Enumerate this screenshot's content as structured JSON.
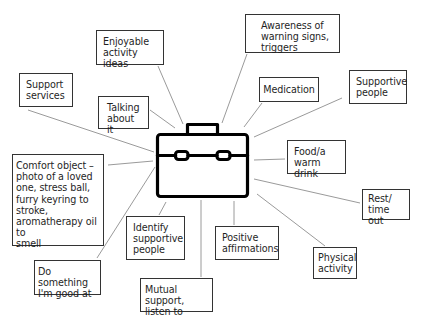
{
  "diagram": {
    "type": "mind-map",
    "center": {
      "icon": "briefcase-icon",
      "label": ""
    },
    "colors": {
      "stroke": "#000000",
      "line": "#9a9a9a",
      "box_border": "#333333",
      "background": "#ffffff"
    },
    "nodes": [
      {
        "id": "enjoyable",
        "label": "Enjoyable\nactivity ideas"
      },
      {
        "id": "awareness",
        "label": "Awareness of\nwarning signs,\ntriggers"
      },
      {
        "id": "support-services",
        "label": "Support\nservices"
      },
      {
        "id": "talking",
        "label": "Talking\nabout it"
      },
      {
        "id": "medication",
        "label": "Medication"
      },
      {
        "id": "supportive-people",
        "label": "Supportive\npeople"
      },
      {
        "id": "comfort",
        "label": "Comfort object –\nphoto of a loved\none, stress ball,\nfurry keyring to\nstroke,\naromatherapy oil to\nsmell"
      },
      {
        "id": "food",
        "label": "Food/a\nwarm drink"
      },
      {
        "id": "rest",
        "label": "Rest/\ntime out"
      },
      {
        "id": "identify",
        "label": "Identify\nsupportive\npeople"
      },
      {
        "id": "positive",
        "label": "Positive\naffirmations"
      },
      {
        "id": "physical",
        "label": "Physical\nactivity"
      },
      {
        "id": "do-something",
        "label": "Do something\nI'm good at"
      },
      {
        "id": "mutual",
        "label": "Mutual support,\nlisten to others"
      }
    ]
  }
}
